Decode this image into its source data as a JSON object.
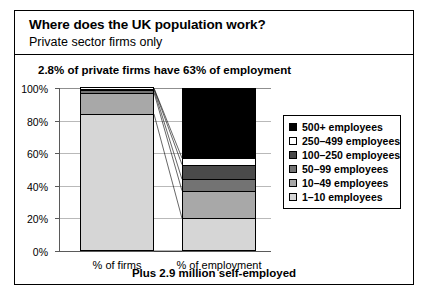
{
  "header": {
    "title": "Where does the UK population work?",
    "subtitle": "Private sector firms only"
  },
  "callout": "2.8% of private firms have 63% of employment",
  "footer": "Plus 2.9 million self-employed",
  "legend": {
    "items": [
      {
        "label": "500+ employees",
        "color": "#000000"
      },
      {
        "label": "250–499 employees",
        "color": "#ffffff"
      },
      {
        "label": "100–250 employees",
        "color": "#4a4a4a"
      },
      {
        "label": "50–99 employees",
        "color": "#737373"
      },
      {
        "label": "10–49 employees",
        "color": "#a8a8a8"
      },
      {
        "label": "1–10 employees",
        "color": "#d6d6d6"
      }
    ]
  },
  "chart_data": {
    "type": "bar",
    "subtype": "100% stacked bar",
    "title": "Where does the UK population work?",
    "subtitle": "Private sector firms only",
    "annotation": "2.8% of private firms have 63% of employment",
    "note": "Plus 2.9 million self-employed",
    "xlabel": "",
    "ylabel": "",
    "ylim": [
      0,
      100
    ],
    "ytick_labels": [
      "0%",
      "20%",
      "40%",
      "60%",
      "80%",
      "100%"
    ],
    "ytick_values": [
      0,
      20,
      40,
      60,
      80,
      100
    ],
    "grid": true,
    "legend_position": "right",
    "categories": [
      "% of firms",
      "% of employment"
    ],
    "series": [
      {
        "name": "1–10 employees",
        "color": "#d6d6d6",
        "values": [
          84.0,
          20.0
        ]
      },
      {
        "name": "10–49 employees",
        "color": "#a8a8a8",
        "values": [
          13.2,
          17.0
        ]
      },
      {
        "name": "50–99 employees",
        "color": "#737373",
        "values": [
          1.6,
          7.0
        ]
      },
      {
        "name": "100–250 employees",
        "color": "#4a4a4a",
        "values": [
          0.8,
          9.0
        ]
      },
      {
        "name": "250–499 employees",
        "color": "#ffffff",
        "values": [
          0.3,
          4.0
        ]
      },
      {
        "name": "500+ employees",
        "color": "#000000",
        "values": [
          0.1,
          43.0
        ]
      }
    ]
  }
}
